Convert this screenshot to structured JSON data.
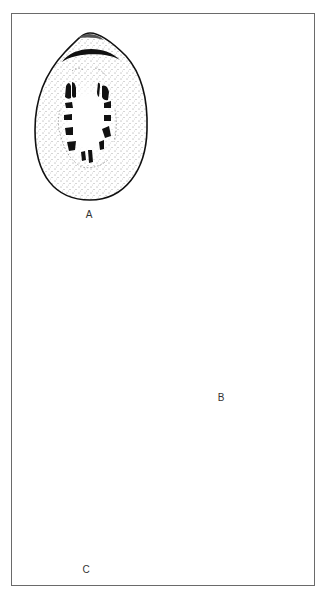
{
  "figure": {
    "panels": [
      {
        "id": "A",
        "label": "A",
        "description": "interior view of limpet shell with horseshoe of muscle scars"
      },
      {
        "id": "B",
        "label": "B",
        "description": "exterior view of shell with concentric growth lines and radial ribs"
      },
      {
        "id": "C",
        "label": "C",
        "description": "dorsal view of chiton with eight plates and girdle"
      }
    ]
  },
  "colors": {
    "ink": "#111111",
    "border": "#6a6a6a",
    "background": "#ffffff"
  }
}
